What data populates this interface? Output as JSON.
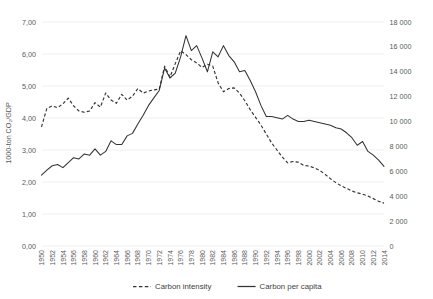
{
  "chart_data": {
    "type": "line",
    "title": "",
    "subtitle": "",
    "xlabel": "",
    "ylabel": "1000-ton CO₂/GDP",
    "ylabel_right": "",
    "grid": true,
    "legend_position": "bottom",
    "x": [
      1950,
      1951,
      1952,
      1953,
      1954,
      1955,
      1956,
      1957,
      1958,
      1959,
      1960,
      1961,
      1962,
      1963,
      1964,
      1965,
      1966,
      1967,
      1968,
      1969,
      1970,
      1971,
      1972,
      1973,
      1974,
      1975,
      1976,
      1977,
      1978,
      1979,
      1980,
      1981,
      1982,
      1983,
      1984,
      1985,
      1986,
      1987,
      1988,
      1989,
      1990,
      1991,
      1992,
      1993,
      1994,
      1995,
      1996,
      1997,
      1998,
      1999,
      2000,
      2001,
      2002,
      2003,
      2004,
      2005,
      2006,
      2007,
      2008,
      2009,
      2010,
      2011,
      2012,
      2013,
      2014
    ],
    "xlim": [
      1950,
      2014
    ],
    "xtick_labels": [
      "1950",
      "1952",
      "1954",
      "1956",
      "1958",
      "1960",
      "1962",
      "1964",
      "1966",
      "1968",
      "1970",
      "1972",
      "1974",
      "1976",
      "1978",
      "1980",
      "1982",
      "1984",
      "1986",
      "1988",
      "1990",
      "1992",
      "1994",
      "1996",
      "1998",
      "2000",
      "2002",
      "2004",
      "2006",
      "2008",
      "2010",
      "2012",
      "2014"
    ],
    "ylim": [
      0,
      7
    ],
    "ytick_labels": [
      "0,00",
      "1,00",
      "2,00",
      "3,00",
      "4,00",
      "5,00",
      "6,00",
      "7,00"
    ],
    "ylim_right": [
      0,
      18000
    ],
    "ytick_labels_right": [
      "0",
      "2 000",
      "4 000",
      "6 000",
      "8 000",
      "10 000",
      "12 000",
      "14 000",
      "16 000",
      "18 000"
    ],
    "series": [
      {
        "name": "Carbon intensity",
        "style": "dashed",
        "axis": "left",
        "color": "#333333",
        "values": [
          3.72,
          4.3,
          4.38,
          4.32,
          4.44,
          4.62,
          4.38,
          4.22,
          4.18,
          4.22,
          4.48,
          4.34,
          4.78,
          4.56,
          4.46,
          4.74,
          4.56,
          4.68,
          4.92,
          4.78,
          4.84,
          4.88,
          4.9,
          5.62,
          5.28,
          5.7,
          6.1,
          5.98,
          5.82,
          5.72,
          5.58,
          5.68,
          5.62,
          5.1,
          4.82,
          4.92,
          4.94,
          4.78,
          4.54,
          4.26,
          4.02,
          3.78,
          3.5,
          3.22,
          3.0,
          2.78,
          2.6,
          2.64,
          2.62,
          2.52,
          2.5,
          2.44,
          2.36,
          2.24,
          2.1,
          1.98,
          1.88,
          1.8,
          1.72,
          1.66,
          1.62,
          1.56,
          1.48,
          1.4,
          1.34
        ]
      },
      {
        "name": "Carbon per capita",
        "style": "solid",
        "axis": "right",
        "color": "#333333",
        "values": [
          5700,
          6100,
          6450,
          6550,
          6300,
          6700,
          7100,
          7000,
          7400,
          7300,
          7800,
          7300,
          7600,
          8450,
          8150,
          8150,
          8850,
          9050,
          9800,
          10500,
          11300,
          11900,
          12500,
          14300,
          13500,
          13900,
          15200,
          16900,
          15700,
          16100,
          15100,
          14000,
          15600,
          15200,
          16100,
          15300,
          14800,
          14000,
          14100,
          13300,
          12400,
          11300,
          10400,
          10400,
          10300,
          10200,
          10500,
          10200,
          10000,
          10000,
          10100,
          10000,
          9900,
          9800,
          9700,
          9500,
          9400,
          9100,
          8700,
          8100,
          8400,
          7600,
          7300,
          6900,
          6400
        ]
      }
    ]
  },
  "legend": {
    "items": [
      {
        "label": "Carbon intensity",
        "style": "dashed"
      },
      {
        "label": "Carbon per capita",
        "style": "solid"
      }
    ]
  },
  "axis_titles": {
    "left": "1000-ton CO₂/GDP"
  }
}
